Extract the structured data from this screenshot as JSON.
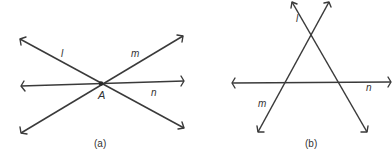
{
  "panels": [
    {
      "caption": "(a)",
      "point_label": "A",
      "lines": [
        {
          "name": "l",
          "x1": 20,
          "y1": 39,
          "x2": 184,
          "y2": 128
        },
        {
          "name": "m",
          "x1": 21,
          "y1": 133,
          "x2": 183,
          "y2": 36
        },
        {
          "name": "n",
          "x1": 21,
          "y1": 86,
          "x2": 184,
          "y2": 81
        }
      ],
      "labels": {
        "l": "l",
        "m": "m",
        "n": "n"
      }
    },
    {
      "caption": "(b)",
      "lines": [
        {
          "name": "l",
          "x1": 292,
          "y1": 2,
          "x2": 367,
          "y2": 132
        },
        {
          "name": "m",
          "x1": 329,
          "y1": 2,
          "x2": 258,
          "y2": 132
        },
        {
          "name": "n",
          "x1": 232,
          "y1": 83,
          "x2": 391,
          "y2": 82
        }
      ],
      "labels": {
        "l": "l",
        "m": "m",
        "n": "n"
      }
    }
  ],
  "colors": {
    "line": "#3a3a3a",
    "text": "#333333",
    "background": "#ffffff"
  }
}
